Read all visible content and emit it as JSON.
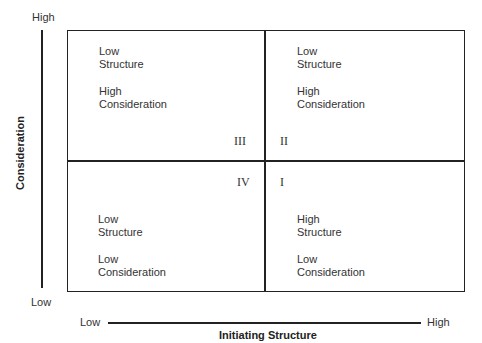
{
  "y_axis": {
    "title": "Consideration",
    "high_label": "High",
    "low_label": "Low"
  },
  "x_axis": {
    "title": "Initiating Structure",
    "low_label": "Low",
    "high_label": "High"
  },
  "quadrants": {
    "III": {
      "numeral": "III",
      "structure_line1": "Low",
      "structure_line2": "Structure",
      "consideration_line1": "High",
      "consideration_line2": "Consideration"
    },
    "II": {
      "numeral": "II",
      "structure_line1": "Low",
      "structure_line2": "Structure",
      "consideration_line1": "High",
      "consideration_line2": "Consideration"
    },
    "IV": {
      "numeral": "IV",
      "structure_line1": "Low",
      "structure_line2": "Structure",
      "consideration_line1": "Low",
      "consideration_line2": "Consideration"
    },
    "I": {
      "numeral": "I",
      "structure_line1": "High",
      "structure_line2": "Structure",
      "consideration_line1": "Low",
      "consideration_line2": "Consideration"
    }
  }
}
